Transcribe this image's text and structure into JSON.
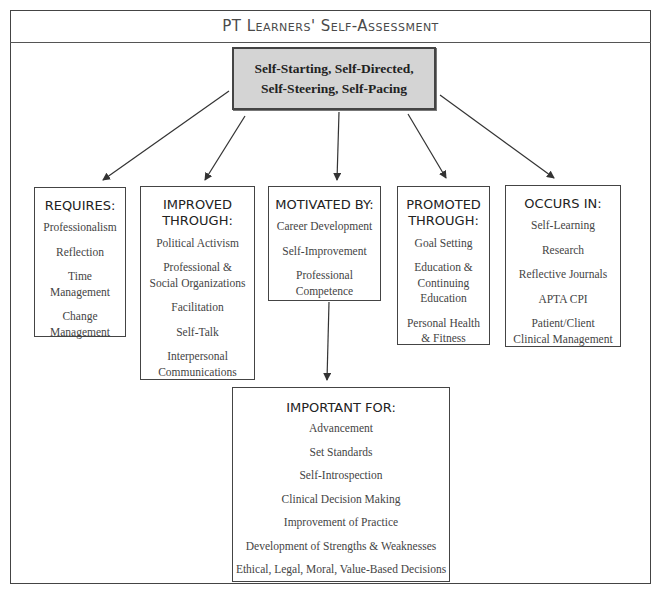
{
  "title": "PT Learners' Self-Assessment",
  "root": {
    "lines": [
      "Self-Starting, Self-Directed,",
      "Self-Steering, Self-Pacing"
    ],
    "fill": "#d4d4d4"
  },
  "children": [
    {
      "heading": [
        "REQUIRES:"
      ],
      "items": [
        [
          "Professionalism"
        ],
        [
          "Reflection"
        ],
        [
          "Time",
          "Management"
        ],
        [
          "Change",
          "Management"
        ]
      ]
    },
    {
      "heading": [
        "IMPROVED",
        "THROUGH:"
      ],
      "items": [
        [
          "Political Activism"
        ],
        [
          "Professional &",
          "Social Organizations"
        ],
        [
          "Facilitation"
        ],
        [
          "Self-Talk"
        ],
        [
          "Interpersonal",
          "Communications"
        ]
      ]
    },
    {
      "heading": [
        "MOTIVATED BY:"
      ],
      "items": [
        [
          "Career Development"
        ],
        [
          "Self-Improvement"
        ],
        [
          "Professional",
          "Competence"
        ]
      ]
    },
    {
      "heading": [
        "PROMOTED",
        "THROUGH:"
      ],
      "items": [
        [
          "Goal Setting"
        ],
        [
          "Education &",
          "Continuing",
          "Education"
        ],
        [
          "Personal Health",
          "& Fitness"
        ]
      ]
    },
    {
      "heading": [
        "OCCURS IN:"
      ],
      "items": [
        [
          "Self-Learning"
        ],
        [
          "Research"
        ],
        [
          "Reflective Journals"
        ],
        [
          "APTA CPI"
        ],
        [
          "Patient/Client",
          "Clinical Management"
        ]
      ]
    }
  ],
  "important_for": {
    "heading": [
      "IMPORTANT FOR:"
    ],
    "items": [
      [
        "Advancement"
      ],
      [
        "Set Standards"
      ],
      [
        "Self-Introspection"
      ],
      [
        "Clinical Decision Making"
      ],
      [
        "Improvement of Practice"
      ],
      [
        "Development of Strengths & Weaknesses"
      ],
      [
        "Ethical, Legal, Moral, Value-Based Decisions"
      ]
    ]
  }
}
